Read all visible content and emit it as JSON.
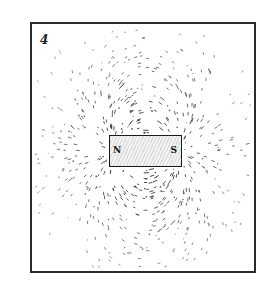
{
  "figure": {
    "number_label": "4",
    "magnet": {
      "north_label": "N",
      "south_label": "S"
    },
    "colors": {
      "ink": "#1a1a1a",
      "paper": "#ffffff",
      "magnet_fill": "#e6e6e6"
    }
  }
}
